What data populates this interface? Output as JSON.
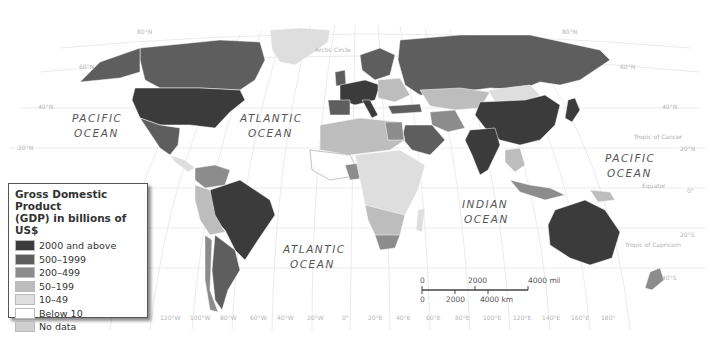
{
  "legend": {
    "title_line1": "Gross Domestic Product",
    "title_line2": "(GDP) in billions of US$",
    "items": [
      {
        "label": "2000 and above",
        "color": "#3b3b3b"
      },
      {
        "label": "500–1999",
        "color": "#5e5e5e"
      },
      {
        "label": "200–499",
        "color": "#8c8c8c"
      },
      {
        "label": "50–199",
        "color": "#bdbdbd"
      },
      {
        "label": "10–49",
        "color": "#dedede"
      },
      {
        "label": "Below 10",
        "color": "#ffffff"
      },
      {
        "label": "No data",
        "color": "#cfcfcf"
      }
    ]
  },
  "oceans": {
    "pacific_west": [
      "PACIFIC",
      "OCEAN"
    ],
    "atlantic_north": [
      "ATLANTIC",
      "OCEAN"
    ],
    "atlantic_south": [
      "ATLANTIC",
      "OCEAN"
    ],
    "indian": [
      "INDIAN",
      "OCEAN"
    ],
    "pacific_east": [
      "PACIFIC",
      "OCEAN"
    ]
  },
  "special_lines": {
    "arctic_circle": "Arctic Circle",
    "tropic_of_cancer": "Tropic of Cancer",
    "equator": "Equator",
    "tropic_of_capricorn": "Tropic of Capricorn"
  },
  "latitude_labels": {
    "west": [
      "80°N",
      "60°N",
      "40°N",
      "20°N"
    ],
    "east": [
      "80°N",
      "60°N",
      "40°N",
      "20°N",
      "0°",
      "20°S",
      "40°S"
    ]
  },
  "longitude_labels": [
    "120°W",
    "100°W",
    "80°W",
    "60°W",
    "40°W",
    "20°W",
    "0°",
    "20°E",
    "40°E",
    "60°E",
    "80°E",
    "100°E",
    "120°E",
    "140°E",
    "160°E",
    "180°"
  ],
  "scale": {
    "miles_labels": [
      "0",
      "2000",
      "4000 miles"
    ],
    "km_labels": [
      "0",
      "2000",
      "4000 km"
    ]
  }
}
